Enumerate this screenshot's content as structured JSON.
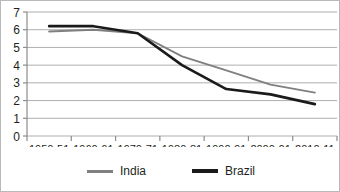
{
  "chart_data": {
    "type": "line",
    "title": "",
    "xlabel": "",
    "ylabel": "",
    "categories": [
      "1950-51",
      "1960-61",
      "1970-71",
      "1980-81",
      "1990-91",
      "2000-01",
      "2010-11"
    ],
    "ylim": [
      0,
      7
    ],
    "yticks": [
      "0",
      "1",
      "2",
      "3",
      "4",
      "5",
      "6",
      "7"
    ],
    "grid": true,
    "legend_position": "bottom",
    "series": [
      {
        "name": "India",
        "color": "#808080",
        "values": [
          5.9,
          6.0,
          5.8,
          4.5,
          3.7,
          2.9,
          2.45
        ]
      },
      {
        "name": "Brazil",
        "color": "#1a1a1a",
        "values": [
          6.2,
          6.2,
          5.8,
          4.0,
          2.65,
          2.35,
          1.8
        ]
      }
    ]
  },
  "legend": {
    "items": [
      {
        "label": "India",
        "swatch": "line-swatch-gray"
      },
      {
        "label": "Brazil",
        "swatch": "line-swatch-black"
      }
    ]
  },
  "axes": {
    "y_tick_labels": [
      "7",
      "6",
      "5",
      "4",
      "3",
      "2",
      "1",
      "0"
    ],
    "x_tick_labels": [
      "1950-51",
      "1960-61",
      "1970-71",
      "1980-81",
      "1990-91",
      "2000-01",
      "2010-11"
    ]
  }
}
